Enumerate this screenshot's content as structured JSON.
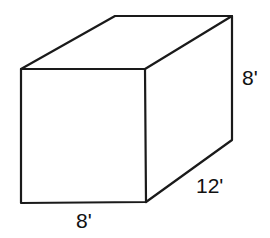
{
  "figure": {
    "type": "rectangular-prism",
    "dimensions": {
      "width": "8'",
      "depth": "12'",
      "height": "8'"
    },
    "labels": {
      "height_label": "8'",
      "depth_label": "12'",
      "width_label": "8'"
    },
    "colors": {
      "stroke": "#1a1a1a",
      "background": "#ffffff"
    }
  }
}
